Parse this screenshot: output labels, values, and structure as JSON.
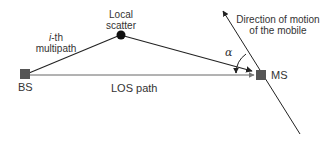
{
  "diagram": {
    "nodes": {
      "bs": {
        "label": "BS"
      },
      "ms": {
        "label": "MS"
      },
      "scatter": {
        "label_line1": "Local",
        "label_line2": "scatter"
      }
    },
    "edges": {
      "multipath": {
        "label_prefix": "i",
        "label_line1_suffix": "-th",
        "label_line2": "multipath"
      },
      "los": {
        "label": "LOS path"
      },
      "motion": {
        "label_line1": "Direction of motion",
        "label_line2": "of the mobile"
      }
    },
    "angle": {
      "symbol": "α"
    },
    "colors": {
      "node": "#555555",
      "line": "#222222",
      "los_line": "#666666",
      "text": "#333333"
    }
  }
}
